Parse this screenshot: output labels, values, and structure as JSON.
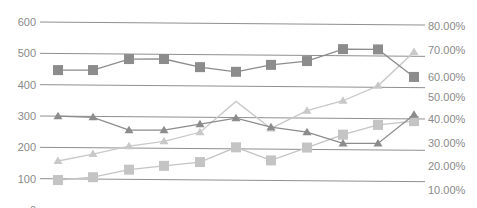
{
  "chart_data": {
    "type": "line",
    "title": "",
    "xlabel": "",
    "ylabel": "",
    "y2label": "",
    "grid": true,
    "legend": null,
    "x": [
      1,
      2,
      3,
      4,
      5,
      6,
      7,
      8,
      9,
      10,
      11
    ],
    "left_axis": {
      "ticks": [
        "0",
        "100",
        "200",
        "300",
        "400",
        "500",
        "600"
      ],
      "ylim": [
        0,
        600
      ]
    },
    "right_axis": {
      "ticks": [
        "10.00%",
        "20.00%",
        "30.00%",
        "40.00%",
        "50.00%",
        "60.00%",
        "70.00%",
        "80.00%"
      ],
      "ylim": [
        0.1,
        0.8
      ]
    },
    "series": [
      {
        "name": "Series A (dark squares)",
        "axis": "left",
        "marker": "square",
        "color": "#8c8c8c",
        "values": [
          447,
          448,
          484,
          485,
          460,
          446,
          469,
          482,
          521,
          521,
          434
        ]
      },
      {
        "name": "Series B (dark triangles)",
        "axis": "left",
        "marker": "triangle",
        "color": "#8c8c8c",
        "values": [
          300,
          297,
          257,
          258,
          278,
          298,
          270,
          255,
          220,
          221,
          313
        ]
      },
      {
        "name": "Series C (light triangles)",
        "axis": "right",
        "marker": "triangle",
        "color": "#c8c8c8",
        "values": [
          0.224,
          0.254,
          0.288,
          0.309,
          0.348,
          0.48,
          0.365,
          0.441,
          0.484,
          0.548,
          0.693
        ],
        "hidden_markers": [
          5
        ]
      },
      {
        "name": "Series D (light squares)",
        "axis": "left",
        "marker": "square",
        "color": "#c4c4c4",
        "values": [
          96,
          106,
          131,
          144,
          157,
          205,
          164,
          206,
          248,
          280,
          293
        ]
      }
    ]
  },
  "layout": {
    "x_pixels": [
      58,
      93,
      129,
      164,
      200,
      236,
      271,
      307,
      343,
      378,
      414
    ],
    "gridline_color": "#8f8f8f",
    "axis_label_color": "#8a8a8a"
  }
}
